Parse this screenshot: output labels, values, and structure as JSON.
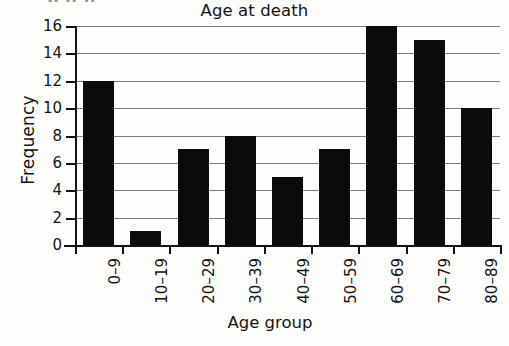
{
  "artifact": {
    "top_clipped_text": "g g p"
  },
  "chart_data": {
    "type": "bar",
    "title": "Age at death",
    "xlabel": "Age group",
    "ylabel": "Frequency",
    "categories": [
      "0–9",
      "10–19",
      "20–29",
      "30–39",
      "40–49",
      "50–59",
      "60–69",
      "70–79",
      "80–89"
    ],
    "values": [
      12,
      1,
      7,
      8,
      5,
      7,
      16,
      15,
      10
    ],
    "ylim": [
      0,
      16
    ],
    "ytick_labels": [
      "0",
      "2",
      "4",
      "6",
      "8",
      "10",
      "12",
      "14",
      "16"
    ],
    "ytick_values": [
      0,
      2,
      4,
      6,
      8,
      10,
      12,
      14,
      16
    ],
    "grid": "horizontal",
    "legend": "none",
    "bar_color": "#0b0b0b",
    "grid_color": "#7c7c7c",
    "background_color": "#fdfdfc",
    "xtick_label_rotation": 90
  }
}
